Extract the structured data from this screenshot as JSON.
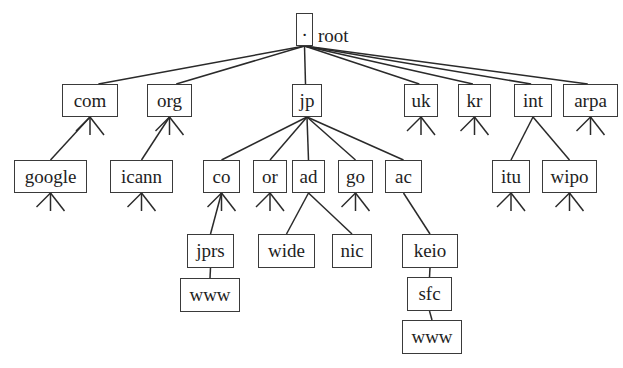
{
  "diagram": {
    "type": "DNS namespace tree",
    "root": {
      "id": "root",
      "glyph": ".",
      "label": "root",
      "box": [
        296,
        13,
        17,
        33
      ]
    },
    "nodes": [
      {
        "id": "com",
        "label": "com",
        "box": [
          62,
          84,
          56,
          33
        ],
        "parent": "root",
        "more_children": true
      },
      {
        "id": "org",
        "label": "org",
        "box": [
          147,
          84,
          45,
          33
        ],
        "parent": "root",
        "more_children": true
      },
      {
        "id": "jp",
        "label": "jp",
        "box": [
          292,
          84,
          30,
          33
        ],
        "parent": "root",
        "more_children": false
      },
      {
        "id": "uk",
        "label": "uk",
        "box": [
          404,
          84,
          34,
          33
        ],
        "parent": "root",
        "more_children": true
      },
      {
        "id": "kr",
        "label": "kr",
        "box": [
          458,
          84,
          33,
          33
        ],
        "parent": "root",
        "more_children": true
      },
      {
        "id": "int",
        "label": "int",
        "box": [
          514,
          84,
          38,
          33
        ],
        "parent": "root",
        "more_children": false
      },
      {
        "id": "arpa",
        "label": "arpa",
        "box": [
          563,
          84,
          55,
          33
        ],
        "parent": "root",
        "more_children": true
      },
      {
        "id": "google",
        "label": "google",
        "box": [
          14,
          160,
          73,
          33
        ],
        "parent": "com",
        "more_children": true
      },
      {
        "id": "icann",
        "label": "icann",
        "box": [
          110,
          160,
          63,
          33
        ],
        "parent": "org",
        "more_children": true
      },
      {
        "id": "co",
        "label": "co",
        "box": [
          203,
          160,
          37,
          33
        ],
        "parent": "jp",
        "more_children": true
      },
      {
        "id": "or",
        "label": "or",
        "box": [
          253,
          160,
          34,
          33
        ],
        "parent": "jp",
        "more_children": true
      },
      {
        "id": "ad",
        "label": "ad",
        "box": [
          292,
          160,
          33,
          33
        ],
        "parent": "jp",
        "more_children": false
      },
      {
        "id": "go",
        "label": "go",
        "box": [
          338,
          160,
          35,
          33
        ],
        "parent": "jp",
        "more_children": true
      },
      {
        "id": "ac",
        "label": "ac",
        "box": [
          385,
          160,
          37,
          33
        ],
        "parent": "jp",
        "more_children": false
      },
      {
        "id": "itu",
        "label": "itu",
        "box": [
          492,
          160,
          38,
          33
        ],
        "parent": "int",
        "more_children": true
      },
      {
        "id": "wipo",
        "label": "wipo",
        "box": [
          542,
          160,
          55,
          33
        ],
        "parent": "int",
        "more_children": true
      },
      {
        "id": "jprs",
        "label": "jprs",
        "box": [
          187,
          234,
          47,
          34
        ],
        "parent": "co",
        "more_children": false
      },
      {
        "id": "wide",
        "label": "wide",
        "box": [
          258,
          234,
          57,
          34
        ],
        "parent": "ad",
        "more_children": false
      },
      {
        "id": "nic",
        "label": "nic",
        "box": [
          332,
          234,
          40,
          34
        ],
        "parent": "ad",
        "more_children": false
      },
      {
        "id": "keio",
        "label": "keio",
        "box": [
          402,
          234,
          56,
          34
        ],
        "parent": "ac",
        "more_children": false
      },
      {
        "id": "www_jprs",
        "label": "www",
        "box": [
          180,
          278,
          60,
          34
        ],
        "parent": "jprs",
        "more_children": false
      },
      {
        "id": "sfc",
        "label": "sfc",
        "box": [
          407,
          277,
          45,
          34
        ],
        "parent": "keio",
        "more_children": false
      },
      {
        "id": "www_keio",
        "label": "www",
        "box": [
          402,
          320,
          60,
          34
        ],
        "parent": "sfc",
        "more_children": false
      }
    ]
  }
}
